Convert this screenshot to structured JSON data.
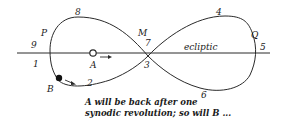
{
  "diagram": {
    "ecliptic_label": "ecliptic",
    "points": {
      "A": "A",
      "B": "B",
      "M": "M",
      "P": "P",
      "Q": "Q"
    },
    "positions": [
      "1",
      "2",
      "3",
      "4",
      "5",
      "6",
      "7",
      "8",
      "9"
    ],
    "caption_line1": "A will be back after one",
    "caption_line2": "synodic revolution; so will B ...",
    "colors": {
      "line": "#2a2a2a",
      "text": "#1a1a1a",
      "background": "#ffffff"
    }
  }
}
